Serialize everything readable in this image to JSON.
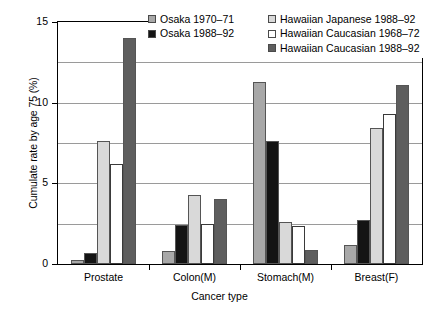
{
  "chart_data": {
    "type": "bar",
    "title": "",
    "xlabel": "Cancer type",
    "ylabel": "Cumulate rate by age 75 (%)",
    "categories": [
      "Prostate",
      "Colon(M)",
      "Stomach(M)",
      "Breast(F)"
    ],
    "ylim": [
      0,
      15
    ],
    "yticks": [
      0,
      5,
      10,
      15
    ],
    "ytick_labels": [
      "0",
      "5",
      "10",
      "15"
    ],
    "gridlines": [
      2.5,
      5,
      7.5,
      10,
      12.5
    ],
    "grid": true,
    "legend_position": "top-right",
    "series": [
      {
        "name": "Osaka 1970–71",
        "color": "#a8a8a8",
        "values": [
          0.25,
          0.8,
          11.3,
          1.2
        ]
      },
      {
        "name": "Osaka 1988–92",
        "color": "#141414",
        "values": [
          0.7,
          2.4,
          7.6,
          2.7
        ]
      },
      {
        "name": "Hawaiian Japanese 1988–92",
        "color": "#d9d9d9",
        "values": [
          7.6,
          4.3,
          2.6,
          8.4
        ]
      },
      {
        "name": "Hawaiian Caucasian 1968–72",
        "color": "#ffffff",
        "values": [
          6.2,
          2.5,
          2.35,
          9.3
        ]
      },
      {
        "name": "Hawaiian Caucasian 1988–92",
        "color": "#5e5e5e",
        "values": [
          14.0,
          4.05,
          0.85,
          11.1
        ]
      }
    ]
  },
  "legend": {
    "items": [
      {
        "label": "Osaka 1970–71",
        "color": "#a8a8a8"
      },
      {
        "label": "Hawaiian Japanese 1988–92",
        "color": "#d9d9d9"
      },
      {
        "label": "Osaka 1988–92",
        "color": "#141414"
      },
      {
        "label": "Hawaiian Caucasian 1968–72",
        "color": "#ffffff"
      },
      {
        "label": "",
        "color": ""
      },
      {
        "label": "Hawaiian Caucasian 1988–92",
        "color": "#5e5e5e"
      }
    ]
  }
}
